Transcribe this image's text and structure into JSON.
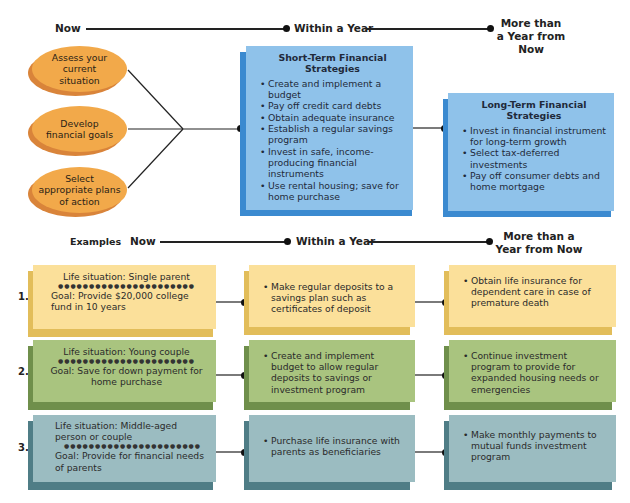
{
  "timeline_top": {
    "now": "Now",
    "within_year": "Within a Year",
    "more_than_year": "More than a Year from Now"
  },
  "steps": [
    {
      "label": "Assess your current situation"
    },
    {
      "label": "Develop financial goals"
    },
    {
      "label": "Select appropriate plans of action"
    }
  ],
  "short_term": {
    "title": "Short-Term Financial Strategies",
    "items": [
      "Create and implement a budget",
      "Pay off credit card debts",
      "Obtain adequate insurance",
      "Establish a regular savings program",
      "Invest in safe, income-producing financial instruments",
      "Use rental housing; save for home purchase"
    ]
  },
  "long_term": {
    "title": "Long-Term Financial Strategies",
    "items": [
      "Invest in financial instrument for long-term growth",
      "Select tax-deferred investments",
      "Pay off consumer debts and home mortgage"
    ]
  },
  "timeline_examples": {
    "examples": "Examples",
    "now": "Now",
    "within_year": "Within a Year",
    "more_than_year": "More than a Year from Now"
  },
  "examples": [
    {
      "number": "1.",
      "life_situation": "Life situation: Single parent",
      "goal": "Goal: Provide $20,000 college fund in 10 years",
      "within_year": "Make regular deposits to a savings plan such as certificates of deposit",
      "long_term": "Obtain life insurance for dependent care in case of premature death",
      "color": "#fbe09a",
      "shadow": "#e2bd5a"
    },
    {
      "number": "2.",
      "life_situation": "Life situation: Young couple",
      "goal": "Goal: Save for down payment for home purchase",
      "within_year": "Create and implement budget to allow regular deposits to savings or investment program",
      "long_term": "Continue investment program to provide for expanded housing needs or emergencies",
      "color": "#a9c47f",
      "shadow": "#6f8f4b"
    },
    {
      "number": "3.",
      "life_situation": "Life situation: Middle-aged person or couple",
      "goal": "Goal: Provide for financial needs of parents",
      "within_year": "Purchase life insurance with parents as beneficiaries",
      "long_term": "Make monthly payments to mutual funds investment program",
      "color": "#9bbcc1",
      "shadow": "#4f7d86"
    }
  ]
}
